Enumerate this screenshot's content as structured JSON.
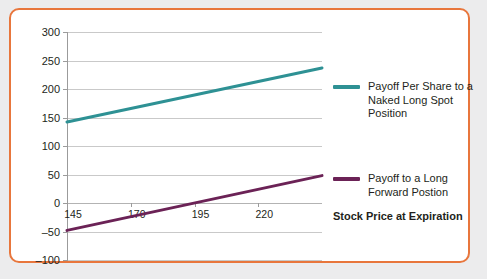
{
  "card": {
    "border_color": "#e8763c",
    "background": "#ffffff"
  },
  "chart_data": {
    "type": "line",
    "title": "",
    "xlabel": "Stock Price at Expiration",
    "ylabel": "",
    "grid": true,
    "legend_position": "right",
    "xlim": [
      145,
      245
    ],
    "ylim": [
      -100,
      300
    ],
    "x_ticks": [
      145,
      170,
      195,
      220
    ],
    "y_ticks": [
      -100,
      -50,
      0,
      50,
      100,
      150,
      200,
      250,
      300
    ],
    "x": [
      145,
      245
    ],
    "series": [
      {
        "name": "Payoff Per Share to a Naked Long Spot Position",
        "color": "#2e9194",
        "values": [
          142,
          237
        ]
      },
      {
        "name": "Payoff to a Long Forward Postion",
        "color": "#6b2256",
        "values": [
          -48,
          48
        ]
      }
    ],
    "legend_entries": [
      {
        "label_lines": [
          "Payoff Per Share to a",
          "Naked Long Spot",
          "Position"
        ],
        "color": "#2e9194"
      },
      {
        "label_lines": [
          "Payoff to a Long",
          "Forward Postion"
        ],
        "color": "#6b2256"
      }
    ]
  }
}
